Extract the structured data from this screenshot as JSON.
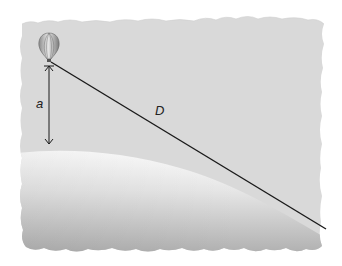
{
  "diagram": {
    "labels": {
      "height": "a",
      "distance": "D"
    },
    "elements": {
      "balloon": "hot-air balloon at observer position",
      "height_arrow": "vertical double-headed arrow from balloon to earth surface",
      "sight_line": "line of sight from balloon tangent to horizon",
      "earth": "curved earth surface with gradient shading",
      "background": "torn-paper grey sky panel"
    },
    "colors": {
      "sky": "#d9d9d9",
      "earth_light": "#ffffff",
      "earth_dark": "#a8a8a8",
      "line": "#1a1a1a",
      "page": "#ffffff"
    }
  }
}
